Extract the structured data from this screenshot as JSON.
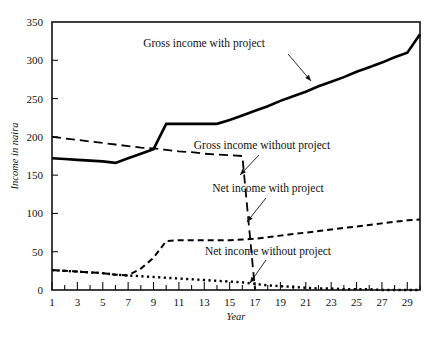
{
  "chart_data": {
    "type": "line",
    "title": "",
    "xlabel": "Year",
    "ylabel": "Income in naira",
    "xlim": [
      1,
      30
    ],
    "ylim": [
      0,
      350
    ],
    "grid": false,
    "legend_position": "inline-annotations",
    "x_ticks_major": [
      1,
      3,
      5,
      7,
      9,
      11,
      13,
      15,
      17,
      19,
      21,
      23,
      25,
      27,
      29
    ],
    "x_ticks_minor": [
      2,
      4,
      6,
      8,
      10,
      12,
      14,
      16,
      18,
      20,
      22,
      24,
      26,
      28,
      30
    ],
    "y_ticks": [
      0,
      50,
      100,
      150,
      200,
      250,
      300,
      350
    ],
    "x": [
      1,
      2,
      3,
      4,
      5,
      6,
      7,
      8,
      9,
      10,
      11,
      12,
      13,
      14,
      15,
      16,
      17,
      18,
      19,
      20,
      21,
      22,
      23,
      24,
      25,
      26,
      27,
      28,
      29,
      30
    ],
    "series": [
      {
        "name": "Gross income with project",
        "style": "solid",
        "stroke_width": 2.6,
        "values": [
          172,
          171,
          170,
          169,
          168,
          166,
          172,
          178,
          184,
          217,
          217,
          217,
          217,
          217,
          222,
          228,
          234,
          240,
          247,
          253,
          259,
          266,
          272,
          278,
          285,
          291,
          297,
          304,
          310,
          334
        ]
      },
      {
        "name": "Gross income without project",
        "style": "long-dash",
        "stroke_width": 1.8,
        "values": [
          200,
          198,
          196,
          194,
          192,
          190,
          188,
          186,
          185,
          183,
          181,
          180,
          178,
          177,
          176,
          175,
          0,
          null,
          null,
          null,
          null,
          null,
          null,
          null,
          null,
          null,
          null,
          null,
          null,
          null
        ]
      },
      {
        "name": "Net income with project",
        "style": "short-dash",
        "stroke_width": 2.0,
        "values": [
          26,
          25,
          24,
          23,
          22,
          20,
          19,
          28,
          42,
          64,
          65,
          65,
          65,
          65,
          65,
          66,
          67,
          69,
          71,
          73,
          75,
          77,
          79,
          81,
          83,
          85,
          87,
          89,
          91,
          92
        ]
      },
      {
        "name": "Net income without project",
        "style": "dotted",
        "stroke_width": 2.4,
        "values": [
          26,
          25,
          24,
          23,
          22,
          20,
          19,
          18,
          17,
          16,
          15,
          14,
          13,
          12,
          11,
          10,
          8,
          6,
          5,
          4,
          3,
          2,
          2,
          1,
          1,
          1,
          0,
          0,
          0,
          0
        ]
      }
    ],
    "annotations": [
      {
        "text": "Gross income with project",
        "text_x": 204,
        "text_y": 47,
        "leader_from_x": 288,
        "leader_from_y": 54,
        "leader_to_x": 311,
        "leader_to_y": 81
      },
      {
        "text": "Gross income without project",
        "text_x": 262,
        "text_y": 149,
        "leader_from_x": 259,
        "leader_from_y": 155,
        "leader_to_x": 240,
        "leader_to_y": 175
      },
      {
        "text": "Net income with project",
        "text_x": 268,
        "text_y": 192,
        "leader_from_x": 266,
        "leader_from_y": 198,
        "leader_to_x": 247,
        "leader_to_y": 222
      },
      {
        "text": "Net income without project",
        "text_x": 268,
        "text_y": 255,
        "leader_from_x": 266,
        "leader_from_y": 260,
        "leader_to_x": 250,
        "leader_to_y": 283
      }
    ]
  },
  "axes": {
    "x_title": "Year",
    "y_title": "Income in naira",
    "y_tick_labels": [
      "0",
      "50",
      "100",
      "150",
      "200",
      "250",
      "300",
      "350"
    ],
    "x_tick_labels": [
      "1",
      "3",
      "5",
      "7",
      "9",
      "11",
      "13",
      "15",
      "17",
      "19",
      "21",
      "23",
      "25",
      "27",
      "29"
    ]
  },
  "colors": {
    "ink": "#111111",
    "paper": "#ffffff"
  }
}
